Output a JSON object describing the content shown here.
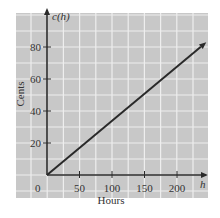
{
  "chart_data": {
    "type": "line",
    "title": "",
    "xlabel": "Hours",
    "ylabel": "Cents",
    "x_axis_var": "h",
    "y_axis_var": "c(h)",
    "xlim": [
      0,
      250
    ],
    "ylim": [
      0,
      90
    ],
    "x_ticks": [
      50,
      100,
      150,
      200
    ],
    "y_ticks": [
      20,
      40,
      60,
      80
    ],
    "origin_label": "0",
    "grid": true,
    "legend": null,
    "series": [
      {
        "name": "c(h)",
        "x": [
          0,
          245
        ],
        "y": [
          0,
          83
        ],
        "arrow_end": true
      }
    ],
    "colors": {
      "panel": "#c8c8c8",
      "grid": "#eeeeee",
      "axis": "#2a2a2a",
      "line": "#2a2a2a"
    }
  },
  "labels": {
    "xlabel": "Hours",
    "ylabel": "Cents",
    "x_var": "h",
    "y_var": "c(h)",
    "origin": "0"
  }
}
